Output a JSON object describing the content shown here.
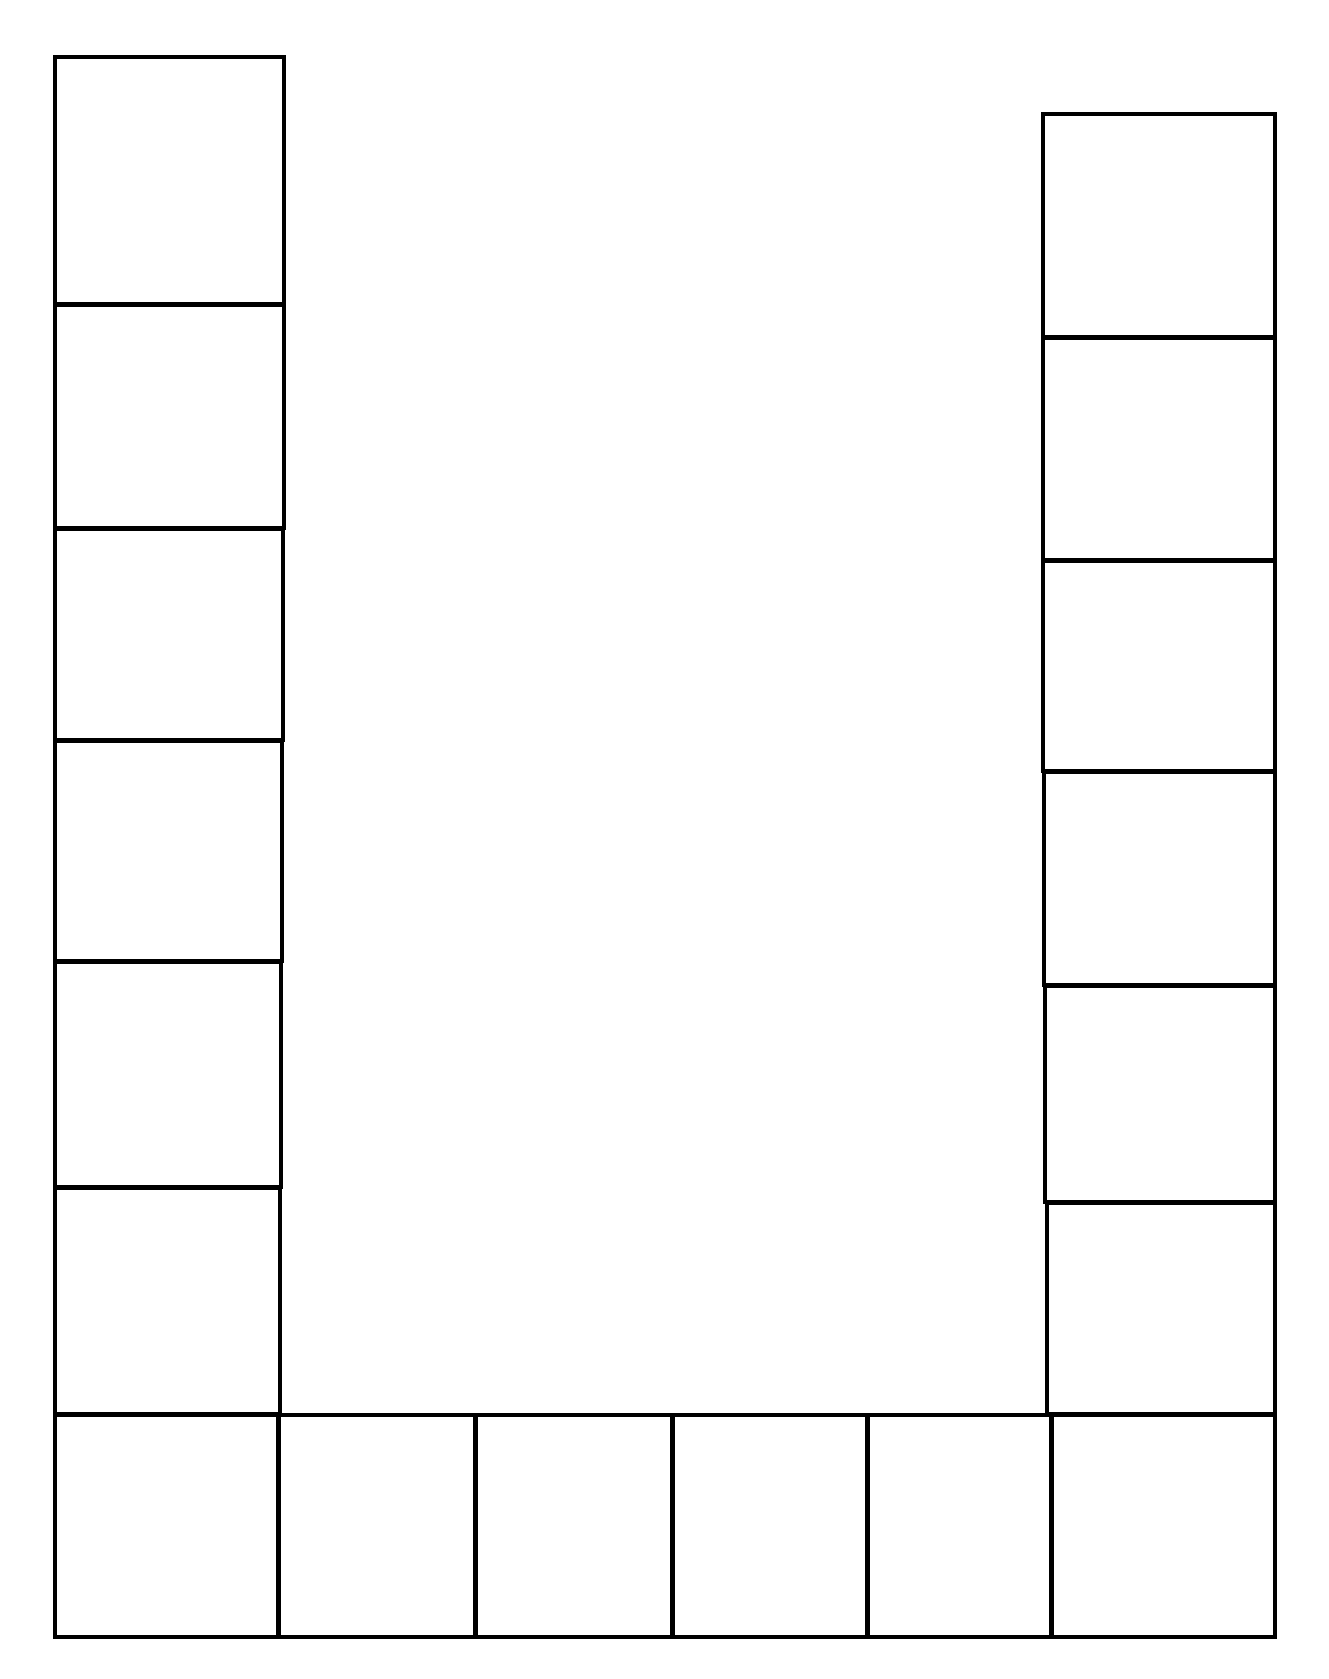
{
  "board": {
    "type": "U-shaped game board template",
    "line_color": "#000000",
    "background": "#ffffff",
    "left_column": [
      {
        "x": 53,
        "y": 55,
        "w": 233,
        "h": 251
      },
      {
        "x": 53,
        "y": 303,
        "w": 233,
        "h": 227
      },
      {
        "x": 53,
        "y": 527,
        "w": 232,
        "h": 215
      },
      {
        "x": 53,
        "y": 739,
        "w": 231,
        "h": 224
      },
      {
        "x": 53,
        "y": 960,
        "w": 230,
        "h": 229
      },
      {
        "x": 53,
        "y": 1186,
        "w": 229,
        "h": 230
      }
    ],
    "right_column": [
      {
        "x": 1041,
        "y": 112,
        "w": 236,
        "h": 227
      },
      {
        "x": 1041,
        "y": 336,
        "w": 236,
        "h": 226
      },
      {
        "x": 1041,
        "y": 559,
        "w": 236,
        "h": 214
      },
      {
        "x": 1042,
        "y": 770,
        "w": 235,
        "h": 217
      },
      {
        "x": 1043,
        "y": 984,
        "w": 234,
        "h": 220
      },
      {
        "x": 1045,
        "y": 1201,
        "w": 232,
        "h": 215
      }
    ],
    "bottom_row": [
      {
        "x": 53,
        "y": 1413,
        "w": 227,
        "h": 226
      },
      {
        "x": 277,
        "y": 1413,
        "w": 200,
        "h": 226
      },
      {
        "x": 474,
        "y": 1413,
        "w": 200,
        "h": 226
      },
      {
        "x": 671,
        "y": 1413,
        "w": 198,
        "h": 226
      },
      {
        "x": 866,
        "y": 1413,
        "w": 187,
        "h": 226
      },
      {
        "x": 1050,
        "y": 1413,
        "w": 227,
        "h": 226
      }
    ]
  }
}
